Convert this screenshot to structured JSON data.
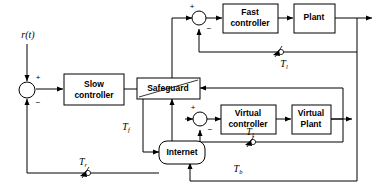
{
  "diagram": {
    "colors": {
      "line": "#000000",
      "box_fill": "#ffffff",
      "background": "#ffffff"
    },
    "blocks": [
      {
        "id": "slow_controller",
        "label_line1": "Slow",
        "label_line2": "controller",
        "shape": "rect"
      },
      {
        "id": "safeguard",
        "label_line1": "Safeguard",
        "label_line2": "",
        "shape": "rect-diagonal"
      },
      {
        "id": "internet",
        "label_line1": "Internet",
        "label_line2": "",
        "shape": "rounded-rect"
      },
      {
        "id": "fast_controller",
        "label_line1": "Fast",
        "label_line2": "controller",
        "shape": "rect"
      },
      {
        "id": "plant",
        "label_line1": "Plant",
        "label_line2": "",
        "shape": "rect"
      },
      {
        "id": "virtual_controller",
        "label_line1": "Virtual",
        "label_line2": "controller",
        "shape": "rect"
      },
      {
        "id": "virtual_plant",
        "label_line1": "Virtual",
        "label_line2": "Plant",
        "shape": "rect"
      }
    ],
    "signals": [
      {
        "id": "reference",
        "base": "r",
        "arg": "(t)",
        "full": "r(t)"
      },
      {
        "id": "tf",
        "base": "T",
        "sub": "f",
        "full": "Tf"
      },
      {
        "id": "tr",
        "base": "T",
        "sub": "r",
        "full": "Tr"
      },
      {
        "id": "tb",
        "base": "T",
        "sub": "b",
        "full": "Tb"
      },
      {
        "id": "tl_top",
        "base": "T",
        "sub": "l",
        "full": "Tl"
      },
      {
        "id": "tl_bottom",
        "base": "T",
        "sub": "l",
        "full": "Tl"
      }
    ],
    "summing_junctions": [
      {
        "id": "sum_main",
        "plus": "+",
        "minus": "−"
      },
      {
        "id": "sum_fast",
        "plus": "+",
        "minus": "−"
      },
      {
        "id": "sum_virtual",
        "plus": "+",
        "minus": "−"
      }
    ],
    "delay_markers": [
      {
        "id": "delay_tr",
        "kind": "switch-delay-icon"
      },
      {
        "id": "delay_tl_top",
        "kind": "switch-delay-icon"
      },
      {
        "id": "delay_tl_bottom",
        "kind": "switch-delay-icon"
      }
    ]
  }
}
